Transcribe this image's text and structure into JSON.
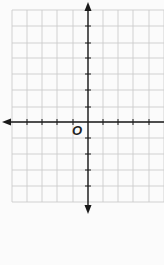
{
  "diagram": {
    "type": "coordinate-plane",
    "origin_label": "O",
    "grid": {
      "left": 12,
      "right": 164,
      "top": 10,
      "bottom": 202,
      "x_lines": [
        12,
        27,
        42,
        57,
        73,
        88,
        103,
        118,
        133,
        149,
        164
      ],
      "y_lines": [
        10,
        26,
        43,
        58,
        74,
        90,
        107,
        122,
        138,
        154,
        170,
        186,
        202
      ],
      "line_color": "#c8c8c8"
    },
    "axes": {
      "color": "#1a1a1a",
      "origin": {
        "x": 88,
        "y": 122
      },
      "x_axis": {
        "from": 2,
        "to": 164,
        "arrow_left": true,
        "arrow_right": false
      },
      "y_axis": {
        "from": 2,
        "to": 214,
        "arrow_top": true,
        "arrow_bottom": true
      },
      "x_ticks": [
        27,
        42,
        57,
        73,
        103,
        118,
        133,
        149
      ],
      "y_ticks": [
        26,
        43,
        58,
        74,
        90,
        107,
        138,
        154,
        170,
        186
      ]
    }
  }
}
